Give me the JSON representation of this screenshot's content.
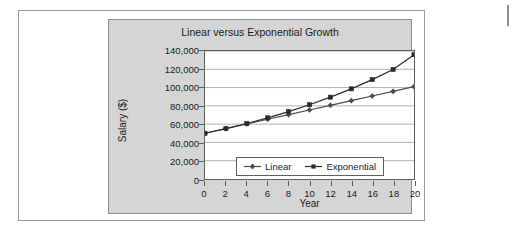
{
  "chart_data": {
    "type": "line",
    "title": "Linear versus Exponential Growth",
    "xlabel": "Year",
    "ylabel": "Salary ($)",
    "x": [
      0,
      2,
      4,
      6,
      8,
      10,
      12,
      14,
      16,
      18,
      20
    ],
    "xlim": [
      0,
      20
    ],
    "ylim": [
      0,
      140000
    ],
    "xticks": [
      "0",
      "2",
      "4",
      "6",
      "8",
      "10",
      "12",
      "14",
      "16",
      "18",
      "20"
    ],
    "yticks": [
      "0",
      "20,000",
      "40,000",
      "60,000",
      "80,000",
      "100,000",
      "120,000",
      "140,000"
    ],
    "ytick_values": [
      0,
      20000,
      40000,
      60000,
      80000,
      100000,
      120000,
      140000
    ],
    "grid": "horizontal",
    "legend_position": "inside-bottom-center",
    "series": [
      {
        "name": "Linear",
        "marker": "diamond",
        "color": "#4a4a4a",
        "values": [
          50000,
          55100,
          60200,
          65300,
          70400,
          75500,
          80600,
          85700,
          90800,
          95900,
          101000
        ]
      },
      {
        "name": "Exponential",
        "marker": "square",
        "color": "#2b2b2b",
        "values": [
          50000,
          55100,
          60700,
          66900,
          73700,
          81200,
          89500,
          98600,
          108700,
          119800,
          136000
        ]
      }
    ]
  },
  "colors": {
    "panel_background": "#d5d5d5",
    "plot_background": "#ffffff",
    "axis": "#5e5e5e",
    "gridline": "#b0b0b0",
    "text": "#1b1b1b",
    "card_border": "#9a9a9a"
  }
}
